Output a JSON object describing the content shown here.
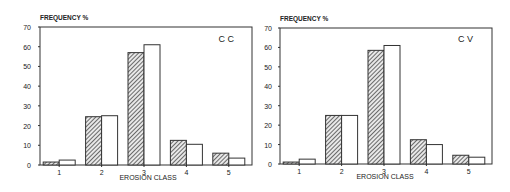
{
  "chart_data": [
    {
      "type": "bar",
      "title": "C C",
      "ylabel": "FREQUENCY %",
      "xlabel": "EROSION CLASS",
      "categories": [
        "1",
        "2",
        "3",
        "4",
        "5"
      ],
      "series": [
        {
          "name": "hatched",
          "pattern": "diagonal-hatch",
          "values": [
            1.5,
            24.5,
            57,
            12.5,
            6
          ]
        },
        {
          "name": "open",
          "pattern": "white",
          "values": [
            2.5,
            25,
            61,
            10.5,
            3.5
          ]
        }
      ],
      "ylim": [
        0,
        70
      ],
      "yticks": [
        0,
        10,
        20,
        30,
        40,
        50,
        60,
        70
      ],
      "grid": false,
      "legend": "none"
    },
    {
      "type": "bar",
      "title": "C V",
      "ylabel": "FREQUENCY %",
      "xlabel": "EROSION CLASS",
      "categories": [
        "1",
        "2",
        "3",
        "4",
        "5"
      ],
      "series": [
        {
          "name": "hatched",
          "pattern": "diagonal-hatch",
          "values": [
            1,
            25,
            58.5,
            12.5,
            4.5
          ]
        },
        {
          "name": "open",
          "pattern": "white",
          "values": [
            2.5,
            25,
            61,
            10,
            3.5
          ]
        }
      ],
      "ylim": [
        0,
        70
      ],
      "yticks": [
        0,
        10,
        20,
        30,
        40,
        50,
        60,
        70
      ],
      "grid": false,
      "legend": "none"
    }
  ]
}
